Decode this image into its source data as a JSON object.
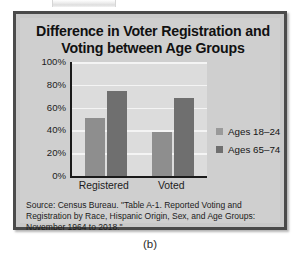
{
  "figure": {
    "caption": "(b)",
    "frame_color": "#4a4a4a",
    "panel_color": "#cfcfcf"
  },
  "source_note": {
    "line1": "Source: Census Bureau. \"Table A-1. Reported Voting and",
    "line2": "Registration by Race, Hispanic Origin, Sex, and Age Groups:",
    "line3": "November 1964 to 2018.\""
  },
  "chart_data": {
    "type": "bar",
    "title": "Difference in Voter Registration and Voting between Age Groups",
    "title_line1": "Difference in Voter Registration and",
    "title_line2": "Voting between Age Groups",
    "xlabel": "",
    "ylabel": "",
    "categories": [
      "Registered",
      "Voted"
    ],
    "series": [
      {
        "name": "Ages 18–24",
        "color": "#8e8e8e",
        "values": [
          51,
          39
        ]
      },
      {
        "name": "Ages 65–74",
        "color": "#6f6f6f",
        "values": [
          75,
          68
        ]
      }
    ],
    "ylim": [
      0,
      100
    ],
    "yticks": [
      100,
      80,
      60,
      40,
      20,
      0
    ],
    "ytick_labels": [
      "100%",
      "80%",
      "60%",
      "40%",
      "20%",
      "0%"
    ],
    "grid": true,
    "grid_color": "#f4f4f4",
    "plot_background": "#dcdcdc",
    "axis_color": "#1a1a1a",
    "legend_position": "right"
  }
}
